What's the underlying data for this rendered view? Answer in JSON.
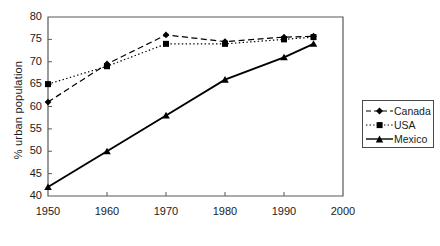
{
  "chart_data": {
    "type": "line",
    "title": "",
    "xlabel": "",
    "ylabel": "% urban population",
    "x": [
      1950,
      1960,
      1970,
      1980,
      1990,
      1995
    ],
    "xlim": [
      1950,
      2000
    ],
    "ylim": [
      40,
      80
    ],
    "xticks": [
      1950,
      1960,
      1970,
      1980,
      1990,
      2000
    ],
    "xtick_labels": [
      "1950",
      "1960",
      "1970",
      "1980",
      "1990",
      "2000"
    ],
    "yticks": [
      40,
      45,
      50,
      55,
      60,
      65,
      70,
      75,
      80
    ],
    "ytick_labels": [
      "40",
      "45",
      "50",
      "55",
      "60",
      "65",
      "70",
      "75",
      "80"
    ],
    "grid": false,
    "legend_position": "right",
    "series": [
      {
        "name": "Canada",
        "values": [
          61,
          69.5,
          76,
          74.5,
          75.5,
          75.7
        ],
        "line_style": "dashed",
        "marker": "diamond",
        "color": "#000000"
      },
      {
        "name": "USA",
        "values": [
          65,
          69,
          74,
          74,
          75,
          75.5
        ],
        "line_style": "dotted",
        "marker": "square",
        "color": "#000000"
      },
      {
        "name": "Mexico",
        "values": [
          42,
          50,
          58,
          66,
          71,
          74
        ],
        "line_style": "solid",
        "marker": "triangle",
        "color": "#000000"
      }
    ]
  },
  "legend": {
    "items": [
      {
        "label": "Canada"
      },
      {
        "label": "USA"
      },
      {
        "label": "Mexico"
      }
    ]
  }
}
